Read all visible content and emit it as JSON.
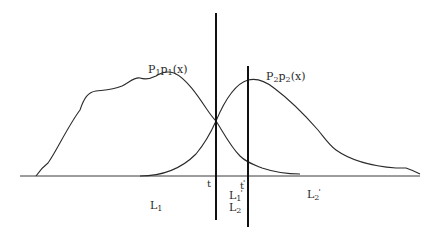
{
  "diagram": {
    "type": "two overlapping probability density curves with decision thresholds",
    "curves": [
      {
        "id": "p1",
        "label_main": "P",
        "label_sub1": "1",
        "label_mid": "p",
        "label_sub2": "1",
        "label_tail": "(x)"
      },
      {
        "id": "p2",
        "label_main": "P",
        "label_sub1": "2",
        "label_mid": "p",
        "label_sub2": "2",
        "label_tail": "(x)"
      }
    ],
    "thresholds": [
      {
        "id": "t",
        "label": "t"
      },
      {
        "id": "t-prime",
        "label": "t",
        "prime": "'"
      }
    ],
    "regions": {
      "L1": {
        "base": "L",
        "sub": "1"
      },
      "L1_prime": {
        "base": "L",
        "sub": "1",
        "prime": "'"
      },
      "L2": {
        "base": "L",
        "sub": "2"
      },
      "L2_prime": {
        "base": "L",
        "sub": "2",
        "prime": "'"
      }
    },
    "colors": {
      "stroke": "#2a2a2a",
      "background": "#ffffff"
    }
  }
}
